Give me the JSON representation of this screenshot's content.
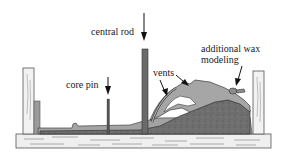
{
  "diagram": {
    "type": "cross-section illustration",
    "labels": {
      "central_rod": "central rod",
      "core_pin": "core pin",
      "vents": "vents",
      "additional_wax_line1": "additional wax",
      "additional_wax_line2": "modeling"
    },
    "colors": {
      "wax": "#a9a9a9",
      "core": "#6e6e6e",
      "rod": "#6a6a6a",
      "wood": "#eeeeee",
      "outline": "#3a3a3a"
    }
  }
}
